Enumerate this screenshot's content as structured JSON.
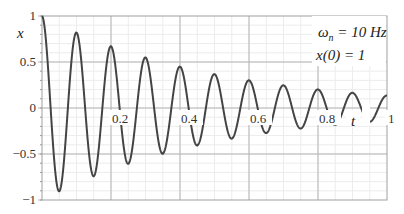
{
  "chart_data": {
    "type": "line",
    "title": "",
    "xlabel": "t",
    "ylabel": "x",
    "xlim": [
      0,
      1
    ],
    "ylim": [
      -1,
      1
    ],
    "x_ticks": [
      "0.2",
      "0.4",
      "0.6",
      "0.8",
      "1"
    ],
    "y_ticks": [
      "1",
      "0.5",
      "0",
      "-0.5",
      "-1"
    ],
    "grid": true,
    "annotations": [
      "ωn = 10 Hz",
      "x(0) = 1"
    ],
    "series": [
      {
        "name": "x(t)",
        "model": "x(t) = exp(-sigma*t) * cos(2*pi*f*t)",
        "f_hz": 10,
        "sigma": 2.0,
        "peak_times": [
          0,
          0.1,
          0.2,
          0.3,
          0.4,
          0.5,
          0.6,
          0.7,
          0.8,
          0.9
        ],
        "peak_values": [
          1.0,
          0.82,
          0.68,
          0.56,
          0.46,
          0.38,
          0.31,
          0.25,
          0.21,
          0.17
        ],
        "trough_times": [
          0.05,
          0.15,
          0.25,
          0.35,
          0.45,
          0.55,
          0.65,
          0.75,
          0.85,
          0.95
        ],
        "trough_values": [
          -0.9,
          -0.74,
          -0.61,
          -0.5,
          -0.41,
          -0.34,
          -0.28,
          -0.23,
          -0.19,
          -0.15
        ]
      }
    ]
  },
  "labels": {
    "y_axis": "x",
    "x_axis": "t",
    "ann_omega": "ω",
    "ann_omega_sub": "n",
    "ann_omega_rest": " = 10 Hz",
    "ann_x0": "x(0) = 1"
  },
  "colors": {
    "curve": "#444444",
    "grid_major": "#b5b5b5",
    "grid_minor": "#ececec",
    "frame": "#a0a0a0"
  }
}
